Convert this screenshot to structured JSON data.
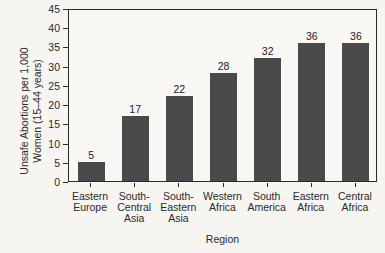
{
  "figure": {
    "background_color": "#f6f5f1",
    "bar_color": "#4a4a4a",
    "axis_color": "#2a2a2a",
    "text_color": "#222222"
  },
  "chart_data": {
    "type": "bar",
    "title": "",
    "xlabel": "Region",
    "ylabel": "Unsafe Abortions per 1,000 Women (15–44 years)",
    "ylabel_lines": [
      "Unsafe Abortions per 1,000",
      "Women (15–44 years)"
    ],
    "categories": [
      "Eastern Europe",
      "South-Central Asia",
      "South-Eastern Asia",
      "Western Africa",
      "South America",
      "Eastern Africa",
      "Central Africa"
    ],
    "categories_wrapped": [
      [
        "Eastern",
        "Europe"
      ],
      [
        "South-",
        "Central",
        "Asia"
      ],
      [
        "South-",
        "Eastern",
        "Asia"
      ],
      [
        "Western",
        "Africa"
      ],
      [
        "South",
        "America"
      ],
      [
        "Eastern",
        "Africa"
      ],
      [
        "Central",
        "Africa"
      ]
    ],
    "values": [
      5,
      17,
      22,
      28,
      32,
      36,
      36
    ],
    "data_labels": [
      "5",
      "17",
      "22",
      "28",
      "32",
      "36",
      "36"
    ],
    "ylim": [
      0,
      45
    ],
    "yticks": [
      0,
      5,
      10,
      15,
      20,
      25,
      30,
      35,
      40,
      45
    ],
    "grid": false,
    "legend": "none",
    "data_labels_shown": true
  }
}
